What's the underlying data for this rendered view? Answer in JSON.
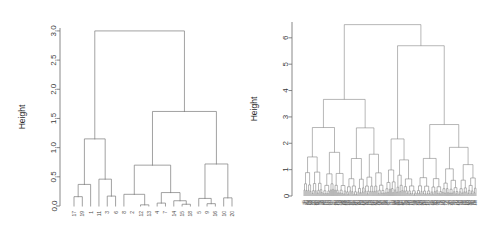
{
  "figure": {
    "background": "#ffffff",
    "line_color": "#7a7a7a",
    "axis_color": "#6b6b6b"
  },
  "chart_data": [
    {
      "id": "left-dendrogram",
      "type": "dendrogram",
      "title": "",
      "xlabel": "",
      "ylabel": "Height",
      "ylim": [
        0.0,
        3.05
      ],
      "yticks": [
        0.0,
        0.5,
        1.0,
        1.5,
        2.0,
        2.5,
        3.0
      ],
      "ytick_labels": [
        "0.0",
        "0.5",
        "1.0",
        "1.5",
        "2.0",
        "2.5",
        "3.0"
      ],
      "grid": false,
      "legend": "none",
      "n_leaves": 20,
      "leaf_labels": [
        "17",
        "19",
        "1",
        "11",
        "3",
        "6",
        "8",
        "2",
        "12",
        "13",
        "4",
        "7",
        "14",
        "15",
        "18",
        "5",
        "9",
        "16",
        "10",
        "20"
      ],
      "leaf_order_note": "labels read left to right beneath the tips",
      "merges": [
        {
          "id": "m1",
          "left": "17",
          "right": "19",
          "height": 0.16
        },
        {
          "id": "m2",
          "left": "1",
          "right": "m1",
          "height": 0.37
        },
        {
          "id": "m3",
          "left": "3",
          "right": "6",
          "height": 0.17
        },
        {
          "id": "m4",
          "left": "11",
          "right": "m3",
          "height": 0.46
        },
        {
          "id": "m5",
          "left": "m2",
          "right": "m4",
          "height": 1.15
        },
        {
          "id": "m6",
          "left": "12",
          "right": "13",
          "height": 0.02
        },
        {
          "id": "m7",
          "left": "8",
          "right": "m6",
          "height": 0.2
        },
        {
          "id": "m8",
          "left": "4",
          "right": "7",
          "height": 0.05
        },
        {
          "id": "m9",
          "left": "15",
          "right": "18",
          "height": 0.03
        },
        {
          "id": "m10",
          "left": "14",
          "right": "m9",
          "height": 0.09
        },
        {
          "id": "m11",
          "left": "m8",
          "right": "m10",
          "height": 0.23
        },
        {
          "id": "m12",
          "left": "m7",
          "right": "m11",
          "height": 0.7
        },
        {
          "id": "m13",
          "left": "9",
          "right": "16",
          "height": 0.04
        },
        {
          "id": "m14",
          "left": "5",
          "right": "m13",
          "height": 0.13
        },
        {
          "id": "m15",
          "left": "10",
          "right": "20",
          "height": 0.14
        },
        {
          "id": "m16",
          "left": "m14",
          "right": "m15",
          "height": 0.72
        },
        {
          "id": "m17",
          "left": "m12",
          "right": "m16",
          "height": 1.62
        },
        {
          "id": "m18",
          "left": "m5",
          "right": "m17",
          "height": 3.0
        }
      ]
    },
    {
      "id": "right-dendrogram",
      "type": "dendrogram",
      "title": "",
      "xlabel": "",
      "ylabel": "Height",
      "ylim": [
        0.0,
        6.6
      ],
      "yticks": [
        0,
        1,
        2,
        3,
        4,
        5,
        6
      ],
      "ytick_labels": [
        "0",
        "1",
        "2",
        "3",
        "4",
        "5",
        "6"
      ],
      "grid": false,
      "legend": "none",
      "n_leaves": 170,
      "leaf_labels_note": "leaf labels are rendered too small to read; drawn as a dense rotated label band",
      "top_structure": {
        "root_height": 6.5,
        "children": [
          {
            "height": 4.05,
            "span": "left half"
          },
          {
            "height": 5.7,
            "span": "right half",
            "children": [
              {
                "height": 3.2
              },
              {
                "height": 3.8,
                "children": [
                  {
                    "height": 2.3
                  }
                ]
              }
            ]
          }
        ]
      },
      "notable_heights": [
        6.5,
        5.7,
        4.05,
        3.8,
        3.2,
        2.8,
        2.55,
        2.3,
        2.05,
        1.65,
        1.5,
        1.4,
        1.25,
        1.05,
        0.8,
        0.55
      ],
      "density_note": "approximately 170 tips; most merges occur below height 1"
    }
  ]
}
